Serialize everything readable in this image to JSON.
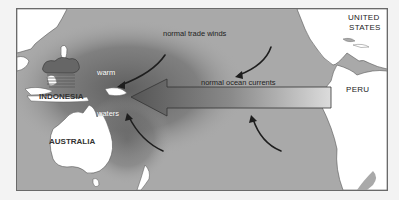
{
  "diagram": {
    "labels": {
      "trade_winds": "normal trade winds",
      "ocean_currents": "normal ocean currents",
      "warm": "warm",
      "waters": "waters",
      "indonesia": "INDONESIA",
      "australia": "AUSTRALIA",
      "peru": "PERU",
      "united_states_line1": "UNITED",
      "united_states_line2": "STATES"
    },
    "colors": {
      "ocean": "#a9a9a9",
      "land": "#ffffff",
      "warm_pool": "#6e6e6e",
      "arrow_dark": "#555555",
      "arrow_light": "#d8d8d8",
      "wind_arrow": "#1e1e1e",
      "frame": "#6a6a6a",
      "background": "#f3f3f3"
    }
  }
}
